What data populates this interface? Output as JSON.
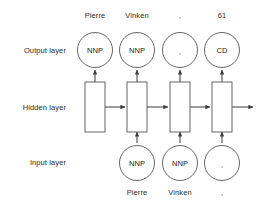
{
  "diagram": {
    "layers": [
      {
        "id": "output",
        "label": "Output layer"
      },
      {
        "id": "hidden",
        "label": "Hidden layer"
      },
      {
        "id": "input",
        "label": "Input layer"
      }
    ],
    "top_labels": [
      {
        "text": "Pierre"
      },
      {
        "text": "Vinken"
      },
      {
        "text": ","
      },
      {
        "text": "61"
      }
    ],
    "output_nodes": [
      {
        "text": "NNP"
      },
      {
        "text": "NNP"
      },
      {
        "text": ","
      },
      {
        "text": "CD"
      }
    ],
    "hidden_nodes": [
      {
        "text": ""
      },
      {
        "text": ""
      },
      {
        "text": ""
      },
      {
        "text": ""
      }
    ],
    "input_nodes": [
      {
        "text": "NNP"
      },
      {
        "text": "NNP"
      },
      {
        "text": ","
      }
    ],
    "bottom_labels": [
      {
        "text": "Pierre"
      },
      {
        "text": "Vinken"
      },
      {
        "text": ","
      }
    ],
    "colors": {
      "stroke": "#555555",
      "arrow": "#3a3a3a",
      "text": "#1a1a1a",
      "background": "#ffffff"
    }
  }
}
